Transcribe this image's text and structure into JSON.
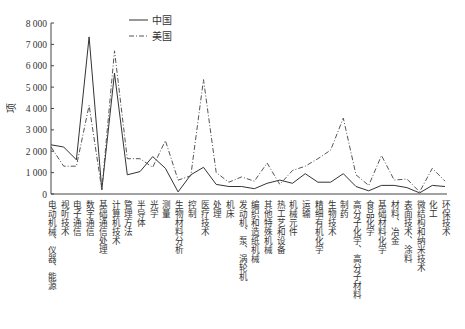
{
  "chart_data": {
    "type": "line",
    "title": "",
    "xlabel": "",
    "ylabel": "项",
    "ylim": [
      0,
      8000
    ],
    "yticks": [
      0,
      1000,
      2000,
      3000,
      4000,
      5000,
      6000,
      7000,
      8000
    ],
    "ytick_labels": [
      "0",
      "1 000",
      "2 000",
      "3 000",
      "4 000",
      "5 000",
      "6 000",
      "7 000",
      "8 000"
    ],
    "grid": false,
    "legend_position": "top-left-inside",
    "categories": [
      "电动机械、仪器、能源",
      "视听技术",
      "电子通信",
      "数字通信",
      "基础通信处理",
      "计算机技术",
      "管理方法",
      "半导体",
      "光学",
      "测量",
      "生物材料分析",
      "控制",
      "医疗技术",
      "处理",
      "机床",
      "发动机、泵、涡轮机",
      "编织和造纸机械",
      "其他特殊机械",
      "热工艺和设备",
      "机械元件",
      "运输",
      "精细有机化学",
      "生物技术",
      "制药",
      "高分子化学、高分子材料",
      "食品化学",
      "基础材料化学",
      "材料、冶金",
      "表面技术、涂料",
      "微结构和纳米技术",
      "化工",
      "环保技术"
    ],
    "series": [
      {
        "name": "中国",
        "style": "solid",
        "values": [
          2300,
          2200,
          1600,
          7350,
          200,
          5650,
          900,
          1050,
          1750,
          1200,
          100,
          900,
          1250,
          450,
          350,
          350,
          250,
          500,
          650,
          500,
          950,
          550,
          550,
          950,
          350,
          150,
          400,
          400,
          300,
          50,
          400,
          350
        ]
      },
      {
        "name": "美国",
        "style": "dash-dot",
        "values": [
          2200,
          1300,
          1300,
          4150,
          200,
          6700,
          1650,
          1650,
          1250,
          2500,
          650,
          850,
          5350,
          1000,
          550,
          800,
          600,
          1450,
          450,
          1100,
          1300,
          1650,
          2050,
          3550,
          900,
          400,
          1800,
          650,
          700,
          100,
          1200,
          600
        ]
      }
    ]
  }
}
